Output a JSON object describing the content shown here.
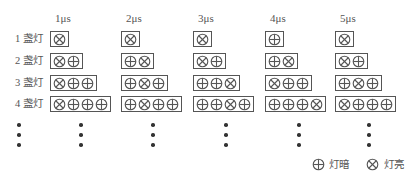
{
  "diagram": {
    "time_labels": [
      "1μs",
      "2μs",
      "3μs",
      "4μs",
      "5μs"
    ],
    "row_labels": [
      "1 盏灯",
      "2 盏灯",
      "3 盏灯",
      "4 盏灯"
    ],
    "legend": {
      "off_symbol": "⊕",
      "off_label": "灯暗",
      "on_symbol": "⊗",
      "on_label": "灯亮"
    },
    "grid": [
      [
        [
          "on"
        ],
        [
          "on"
        ],
        [
          "on"
        ],
        [
          "off"
        ],
        [
          "on"
        ]
      ],
      [
        [
          "on",
          "off"
        ],
        [
          "off",
          "on"
        ],
        [
          "on",
          "off"
        ],
        [
          "off",
          "on"
        ],
        [
          "on",
          "off"
        ]
      ],
      [
        [
          "on",
          "off",
          "off"
        ],
        [
          "off",
          "on",
          "off"
        ],
        [
          "off",
          "off",
          "on"
        ],
        [
          "on",
          "off",
          "off"
        ],
        [
          "off",
          "on",
          "off"
        ]
      ],
      [
        [
          "on",
          "off",
          "off",
          "off"
        ],
        [
          "off",
          "on",
          "off",
          "off"
        ],
        [
          "off",
          "off",
          "on",
          "off"
        ],
        [
          "off",
          "off",
          "off",
          "on"
        ],
        [
          "on",
          "off",
          "off",
          "off"
        ]
      ]
    ],
    "continuation": "vertical ellipsis dots under each column",
    "colors": {
      "line": "#555555",
      "text": "#555555",
      "dot": "#333333"
    }
  }
}
